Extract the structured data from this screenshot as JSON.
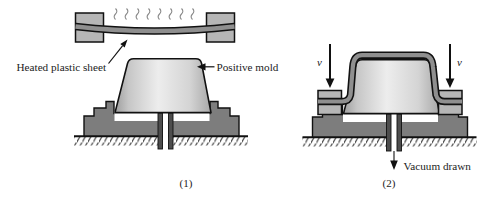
{
  "figure": {
    "panel1": {
      "caption": "(1)",
      "sheet_label": "Heated plastic sheet",
      "mold_label": "Positive mold"
    },
    "panel2": {
      "caption": "(2)",
      "velocity_left": "v",
      "velocity_right": "v",
      "vacuum_label": "Vacuum drawn"
    },
    "colors": {
      "outline": "#111111",
      "mold_highlight": "#ededed",
      "mold_edge": "#9e9e9e",
      "base_gray": "#7d7d7d",
      "sheet_gray": "#8f8f8f",
      "clamp_gray": "#b6b6b6",
      "heat_line_gray": "#8a8a8a"
    }
  }
}
